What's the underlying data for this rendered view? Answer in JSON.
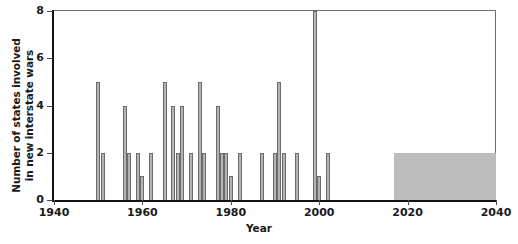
{
  "chart_data": {
    "type": "bar",
    "title": "",
    "xlabel": "Year",
    "ylabel": "Number of states involved\nin new interstate wars",
    "xlim": [
      1940,
      2040
    ],
    "ylim": [
      0,
      8
    ],
    "grid": false,
    "legend": null,
    "xticks": [
      1940,
      1960,
      1980,
      2000,
      2020,
      2040
    ],
    "xtick_labels": [
      "1940",
      "1960",
      "1980",
      "2000",
      "2020",
      "2040"
    ],
    "yticks": [
      0,
      2,
      4,
      6,
      8
    ],
    "ytick_labels": [
      "0",
      "2",
      "4",
      "6",
      "8"
    ],
    "bar_color": "#b3b3b3",
    "bar_edge_color": "#6b6b6b",
    "x": [
      1950,
      1951,
      1956,
      1957,
      1959,
      1960,
      1962,
      1965,
      1967,
      1968,
      1969,
      1971,
      1973,
      1974,
      1977,
      1978,
      1979,
      1980,
      1982,
      1987,
      1990,
      1991,
      1992,
      1995,
      1999,
      2000,
      2002
    ],
    "values": [
      5,
      2,
      4,
      2,
      2,
      1,
      2,
      5,
      4,
      2,
      4,
      2,
      5,
      2,
      4,
      2,
      2,
      1,
      2,
      2,
      2,
      5,
      2,
      2,
      8,
      1,
      2
    ],
    "annotations": [
      {
        "name": "projection-band",
        "type": "shaded-rect",
        "x_start": 2017,
        "x_end": 2040,
        "y_start": 0,
        "y_end": 2,
        "color": "#bcbcbc"
      }
    ]
  }
}
